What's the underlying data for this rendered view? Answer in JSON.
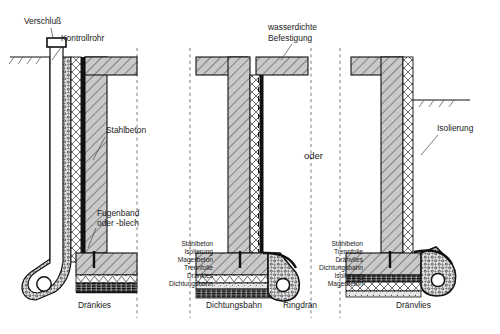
{
  "drawing": {
    "title": "Bauwerksabdichtung Kellerdetail",
    "variant_separator": "oder",
    "colors": {
      "concrete_fill": "#c9c9c9",
      "hatch_line": "#3a3a3a",
      "membrane": "#141414",
      "gravel": "#d8d8d8",
      "outline": "#111111",
      "text": "#1a1a1a",
      "leader": "#444444"
    }
  },
  "left_section": {
    "name": "Variante links - Dränkies",
    "labels": {
      "closure": "Verschluß",
      "control_pipe": "Kontrollrohr",
      "reinforced_concrete": "Stahlbeton",
      "joint_tape": "Fugenband",
      "joint_tape_2": "oder -blech",
      "drain_gravel": "Dränkies"
    }
  },
  "middle_section": {
    "name": "Variante mitte - Dichtungsbahn",
    "labels": {
      "waterproof_fixing_1": "wasserdichte",
      "waterproof_fixing_2": "Befestigung",
      "sealing_sheet": "Dichtungsbahn",
      "ring_drain": "Ringdrän"
    },
    "layer_list": [
      "Stahlbeton",
      "Isolierung",
      "Magerbeton",
      "Trennfolie",
      "Dränkies",
      "Dichtungsbahn"
    ]
  },
  "right_section": {
    "name": "Variante rechts - Dränvlies",
    "labels": {
      "insulation": "Isolierung",
      "drain_fleece": "Dränvlies"
    },
    "layer_list": [
      "Stahlbeton",
      "Trennfolie",
      "Dränvlies",
      "Dichtungsbahn",
      "Isolierung",
      "Magerbeton"
    ]
  }
}
